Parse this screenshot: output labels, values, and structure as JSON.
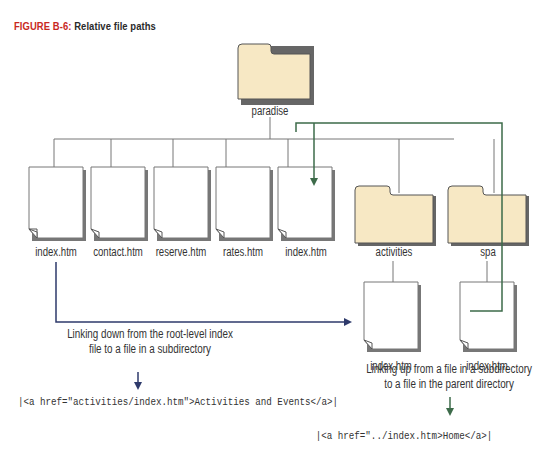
{
  "figure": {
    "number_label": "FIGURE B-6:",
    "title": "Relative file paths",
    "accent_color": "#c8281e"
  },
  "tree": {
    "root_folder": {
      "name": "paradise",
      "icon": "folder-icon"
    },
    "root_files": [
      {
        "name": "index.htm",
        "icon": "document-icon"
      },
      {
        "name": "contact.htm",
        "icon": "document-icon"
      },
      {
        "name": "reserve.htm",
        "icon": "document-icon"
      },
      {
        "name": "rates.htm",
        "icon": "document-icon"
      },
      {
        "name": "index.htm",
        "icon": "document-icon"
      }
    ],
    "subfolders": [
      {
        "name": "activities",
        "icon": "folder-icon",
        "files": [
          {
            "name": "index.htm",
            "icon": "document-icon"
          }
        ]
      },
      {
        "name": "spa",
        "icon": "folder-icon",
        "files": [
          {
            "name": "index.htm",
            "icon": "document-icon"
          }
        ]
      }
    ]
  },
  "links": {
    "down": {
      "caption_line1": "Linking down from the  root-level index",
      "caption_line2": "file to a file in a subdirectory",
      "code": "|<a href=\"activities/index.htm\">Activities and Events</a>|",
      "color": "#2e3a6b"
    },
    "up": {
      "caption_line1": "Linking up from a file in a subdirectory",
      "caption_line2": "to a file in the parent directory",
      "code": "|<a href=\"../index.htm>Home</a>|",
      "color": "#3d6b4a"
    }
  },
  "colors": {
    "folder_fill": "#f7e8c4",
    "folder_stroke": "#555555",
    "line": "#777777"
  }
}
